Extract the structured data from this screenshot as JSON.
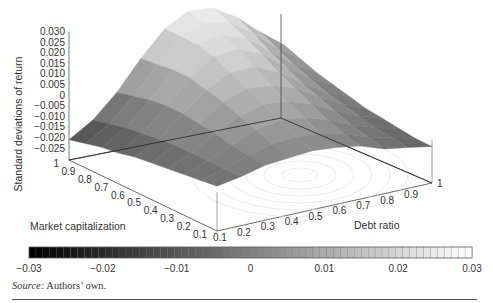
{
  "chart_data": {
    "type": "surface3d",
    "title": "",
    "zlabel": "Standard deviations of return",
    "xlabel": "Debt ratio",
    "ylabel": "Market capitalization",
    "zlim": [
      -0.03,
      0.03
    ],
    "z_ticks": [
      "0.030",
      "0.025",
      "0.020",
      "0.015",
      "0.010",
      "0.005",
      "0",
      "−0.005",
      "−0.010",
      "−0.015",
      "−0.020",
      "−0.025"
    ],
    "debt_ratio_ticks": [
      "0.1",
      "0.2",
      "0.3",
      "0.4",
      "0.5",
      "0.6",
      "0.7",
      "0.8",
      "0.9",
      "1"
    ],
    "market_cap_ticks": [
      "0.1",
      "0.2",
      "0.3",
      "0.4",
      "0.5",
      "0.6",
      "0.7",
      "0.8",
      "0.9",
      "1"
    ],
    "colorbar": {
      "ticks": [
        "−0.03",
        "−0.02",
        "−0.01",
        "0",
        "0.01",
        "0.02",
        "0.03"
      ],
      "colormap": "gray",
      "range": [
        -0.03,
        0.03
      ]
    },
    "debt_ratio": [
      0.1,
      0.2,
      0.3,
      0.4,
      0.5,
      0.6,
      0.7,
      0.8,
      0.9,
      1.0
    ],
    "market_cap": [
      0.1,
      0.2,
      0.3,
      0.4,
      0.5,
      0.6,
      0.7,
      0.8,
      0.9,
      1.0
    ],
    "z_grid_note": "rows = market_cap 0.1..1.0, cols = debt_ratio 0.1..1.0 (estimated)",
    "z": [
      [
        -0.008,
        -0.006,
        -0.003,
        -0.002,
        -0.001,
        -0.002,
        -0.004,
        -0.008,
        -0.01,
        -0.012
      ],
      [
        -0.009,
        -0.006,
        -0.002,
        0.001,
        0.002,
        0.001,
        -0.002,
        -0.006,
        -0.009,
        -0.012
      ],
      [
        -0.01,
        -0.006,
        -0.001,
        0.004,
        0.006,
        0.005,
        0.001,
        -0.004,
        -0.008,
        -0.011
      ],
      [
        -0.011,
        -0.006,
        0.001,
        0.007,
        0.01,
        0.009,
        0.005,
        -0.001,
        -0.006,
        -0.01
      ],
      [
        -0.012,
        -0.006,
        0.002,
        0.01,
        0.014,
        0.013,
        0.009,
        0.002,
        -0.004,
        -0.009
      ],
      [
        -0.013,
        -0.007,
        0.003,
        0.012,
        0.018,
        0.018,
        0.013,
        0.005,
        -0.002,
        -0.007
      ],
      [
        -0.015,
        -0.008,
        0.003,
        0.014,
        0.022,
        0.023,
        0.018,
        0.009,
        0.001,
        -0.005
      ],
      [
        -0.016,
        -0.009,
        0.002,
        0.014,
        0.024,
        0.026,
        0.022,
        0.013,
        0.004,
        -0.003
      ],
      [
        -0.018,
        -0.011,
        0.0,
        0.013,
        0.024,
        0.028,
        0.026,
        0.018,
        0.008,
        0.0
      ],
      [
        -0.02,
        -0.013,
        -0.002,
        0.012,
        0.024,
        0.03,
        0.029,
        0.022,
        0.012,
        0.003
      ]
    ]
  },
  "source": {
    "label": "Source:",
    "text": " Authors’ own."
  }
}
